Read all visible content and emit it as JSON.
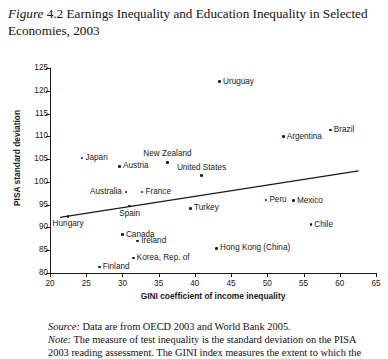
{
  "title": {
    "label": "Figure",
    "number": "4.2",
    "text": "Earnings Inequality and Education Inequality in Selected Economies, 2003"
  },
  "chart_data": {
    "type": "scatter",
    "title": "Earnings Inequality and Education Inequality in Selected Economies, 2003",
    "xlabel": "GINI coefficient of income inequality",
    "ylabel": "PISA standard deviation",
    "xlim": [
      20,
      65
    ],
    "ylim": [
      80,
      125
    ],
    "xticks": [
      20,
      25,
      30,
      35,
      40,
      45,
      50,
      55,
      60,
      65
    ],
    "yticks": [
      80,
      85,
      90,
      95,
      100,
      105,
      110,
      115,
      120,
      125
    ],
    "grid": false,
    "legend": null,
    "trendline": {
      "x0": 21.4,
      "y0": 92.2,
      "x1": 62.6,
      "y1": 102.4
    },
    "points": [
      {
        "name": "Uruguay",
        "x": 43.4,
        "y": 122.0,
        "label_pos": "right"
      },
      {
        "name": "Brazil",
        "x": 58.7,
        "y": 111.4,
        "label_pos": "right"
      },
      {
        "name": "Argentina",
        "x": 52.2,
        "y": 109.9,
        "label_pos": "right"
      },
      {
        "name": "Japan",
        "x": 24.4,
        "y": 105.2,
        "label_pos": "right"
      },
      {
        "name": "New Zealand",
        "x": 36.2,
        "y": 104.3,
        "label_pos": "above"
      },
      {
        "name": "Austria",
        "x": 29.6,
        "y": 103.4,
        "label_pos": "right"
      },
      {
        "name": "United States",
        "x": 40.9,
        "y": 101.4,
        "label_pos": "above"
      },
      {
        "name": "France",
        "x": 32.7,
        "y": 97.8,
        "label_pos": "right"
      },
      {
        "name": "Australia",
        "x": 30.5,
        "y": 97.8,
        "label_pos": "left"
      },
      {
        "name": "Peru",
        "x": 49.8,
        "y": 96.0,
        "label_pos": "right"
      },
      {
        "name": "Mexico",
        "x": 53.6,
        "y": 95.9,
        "label_pos": "right"
      },
      {
        "name": "Spain",
        "x": 31.0,
        "y": 94.7,
        "label_pos": "below"
      },
      {
        "name": "Turkey",
        "x": 39.4,
        "y": 94.2,
        "label_pos": "right"
      },
      {
        "name": "Hungary",
        "x": 22.5,
        "y": 92.4,
        "label_pos": "below"
      },
      {
        "name": "Chile",
        "x": 56.0,
        "y": 90.6,
        "label_pos": "right"
      },
      {
        "name": "Canada",
        "x": 30.0,
        "y": 88.4,
        "label_pos": "right"
      },
      {
        "name": "Ireland",
        "x": 32.1,
        "y": 87.0,
        "label_pos": "right"
      },
      {
        "name": "Hong Kong (China)",
        "x": 43.0,
        "y": 85.4,
        "label_pos": "right"
      },
      {
        "name": "Korea, Rep. of",
        "x": 31.5,
        "y": 83.3,
        "label_pos": "right"
      },
      {
        "name": "Finland",
        "x": 26.8,
        "y": 81.3,
        "label_pos": "right"
      }
    ]
  },
  "notes": {
    "source_lead": "Source:",
    "source_text": " Data are from OECD 2003 and World Bank 2005.",
    "note_lead": "Note:",
    "note_text": " The measure of test inequality is the standard deviation on the PISA",
    "note_text_line3": "2003 reading assessment. The GINI index measures the extent to which the"
  }
}
